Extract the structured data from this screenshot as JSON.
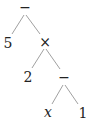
{
  "diagram": {
    "type": "expression-tree",
    "expression": "5 − 2 × (x − 1)",
    "nodes": [
      {
        "id": "n0",
        "label": "−",
        "role": "operator",
        "x": 25,
        "y": 8
      },
      {
        "id": "n1",
        "label": "5",
        "role": "operand",
        "x": 8,
        "y": 43
      },
      {
        "id": "n2",
        "label": "×",
        "role": "operator",
        "x": 45,
        "y": 43
      },
      {
        "id": "n3",
        "label": "2",
        "role": "operand",
        "x": 28,
        "y": 77
      },
      {
        "id": "n4",
        "label": "−",
        "role": "operator",
        "x": 64,
        "y": 78
      },
      {
        "id": "n5",
        "label": "x",
        "role": "variable",
        "x": 48,
        "y": 113
      },
      {
        "id": "n6",
        "label": "1",
        "role": "operand",
        "x": 83,
        "y": 113
      }
    ],
    "edges": [
      {
        "from": "n0",
        "to": "n1"
      },
      {
        "from": "n0",
        "to": "n2"
      },
      {
        "from": "n2",
        "to": "n3"
      },
      {
        "from": "n2",
        "to": "n4"
      },
      {
        "from": "n4",
        "to": "n5"
      },
      {
        "from": "n4",
        "to": "n6"
      }
    ]
  }
}
